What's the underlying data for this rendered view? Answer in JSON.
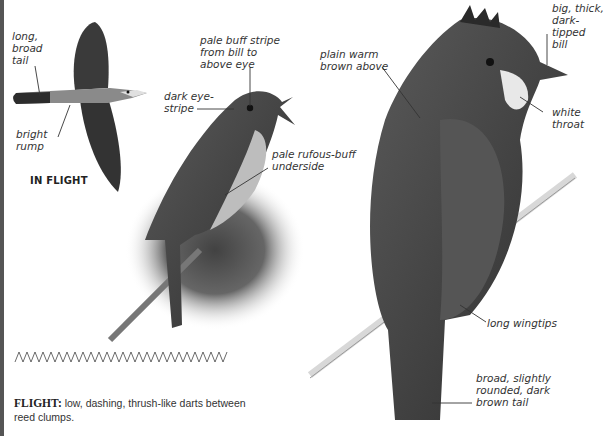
{
  "illustrations": {
    "in_flight": {
      "title": "IN FLIGHT",
      "labels": {
        "tail": "long,\nbroad\ntail",
        "rump": "bright\nrump"
      }
    },
    "singing_bird": {
      "labels": {
        "supercilium": "pale buff stripe\nfrom bill to\nabove eye",
        "eye_stripe": "dark eye-\nstripe",
        "underside": "pale rufous-buff\nunderside"
      }
    },
    "perched_bird": {
      "labels": {
        "upperparts": "plain warm\nbrown above",
        "bill": "big, thick,\ndark-tipped\nbill",
        "throat": "white\nthroat",
        "wingtips": "long wingtips",
        "tail": "broad, slightly\nrounded, dark\nbrown tail"
      }
    }
  },
  "flight_note": {
    "heading": "FLIGHT:",
    "text": " low, dashing, thrush-like darts between reed clumps."
  },
  "colors": {
    "bird_dark": "#2a2a2a",
    "bird_mid": "#6b6b6b",
    "bird_light": "#c9c9c9",
    "text": "#333333"
  }
}
